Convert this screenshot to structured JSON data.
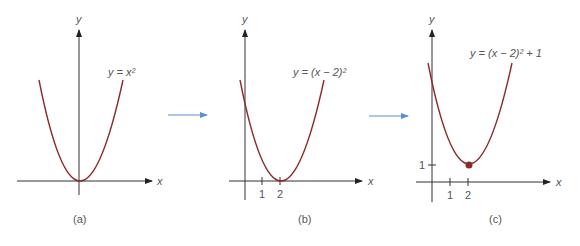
{
  "panels": [
    {
      "id": "a",
      "caption": "(a)",
      "equation": "y = x²",
      "x_axis_label": "x",
      "y_axis_label": "y",
      "ticks": []
    },
    {
      "id": "b",
      "caption": "(b)",
      "equation": "y = (x − 2)²",
      "x_axis_label": "x",
      "y_axis_label": "y",
      "ticks": [
        "1",
        "2"
      ]
    },
    {
      "id": "c",
      "caption": "(c)",
      "equation": "y = (x − 2)² + 1",
      "x_axis_label": "x",
      "y_axis_label": "y",
      "ticks": [
        "1",
        "2"
      ],
      "y_ticks": [
        "1"
      ],
      "vertex_point": "(2, 1)"
    }
  ],
  "colors": {
    "curve": "#8b2a2a",
    "axis": "#333333",
    "arrow": "#5b8fd0",
    "label": "#555555"
  }
}
